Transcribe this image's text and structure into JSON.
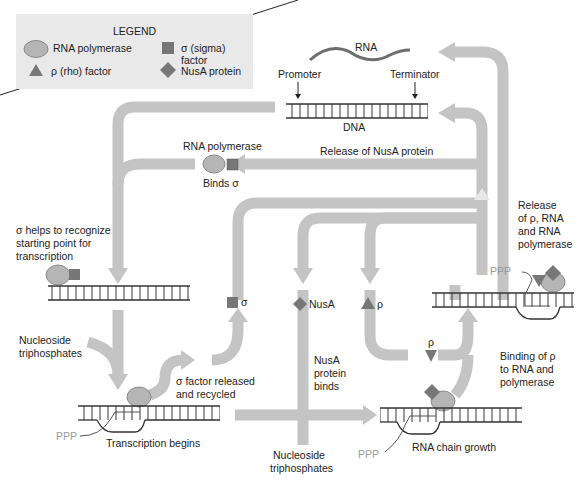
{
  "colors": {
    "arrow": "#c4c4c4",
    "polymerase": "#b5b5b5",
    "factor": "#777777",
    "dna": "#333333",
    "rna": "#6e6e6e",
    "legend_bg": "#e9e9e9",
    "ppp_text": "#999999"
  },
  "legend": {
    "title": "LEGEND",
    "items": [
      {
        "icon": "ellipse",
        "label": "RNA polymerase"
      },
      {
        "icon": "square",
        "label": "σ (sigma) factor"
      },
      {
        "icon": "triangle",
        "label": "ρ (rho) factor"
      },
      {
        "icon": "diamond",
        "label": "NusA protein"
      }
    ]
  },
  "top": {
    "rna_label": "RNA",
    "promoter_label": "Promoter",
    "terminator_label": "Terminator",
    "dna_label": "DNA"
  },
  "steps": {
    "rna_polymerase": "RNA polymerase",
    "binds_sigma": "Binds σ",
    "release_nusa": "Release of NusA protein",
    "sigma_helps": [
      "σ helps to recognize",
      "starting point for",
      "transcription"
    ],
    "release_rho": [
      "Release",
      "of ρ, RNA",
      "and RNA",
      "polymerase"
    ],
    "nucleoside_left": [
      "Nucleoside",
      "triphosphates"
    ],
    "sigma_released": [
      "σ factor released",
      "and recycled"
    ],
    "transcription_begins": "Transcription begins",
    "sigma_symbol": "σ",
    "nusa_label": "NusA",
    "rho_symbol": "ρ",
    "rho_symbol_lower": "ρ",
    "nusa_binds": [
      "NusA",
      "protein",
      "binds"
    ],
    "binding_rho": [
      "Binding of ρ",
      "to RNA and",
      "polymerase"
    ],
    "nucleoside_bottom": [
      "Nucleoside",
      "triphosphates"
    ],
    "rna_chain_growth": "RNA chain growth",
    "ppp": "PPP"
  }
}
